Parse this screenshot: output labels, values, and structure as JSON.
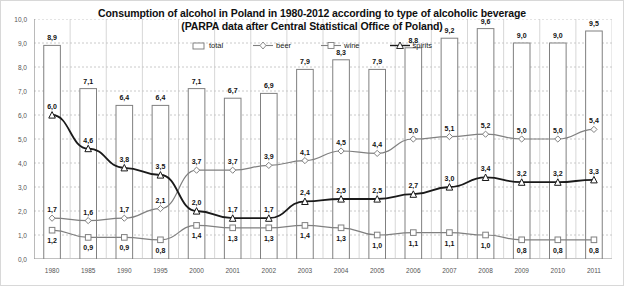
{
  "chart_data": {
    "type": "bar",
    "title": "Consumption of alcohol in Poland in 1980-2012 according to type of alcoholic beverage",
    "subtitle": "(PARPA data after Central Statistical Office of Poland)",
    "xlabel": "",
    "ylabel": "",
    "ylim": [
      0.0,
      10.0
    ],
    "ytick_labels": [
      "0,0",
      "1,0",
      "2,0",
      "3,0",
      "4,0",
      "5,0",
      "6,0",
      "7,0",
      "8,0",
      "9,0",
      "10,0"
    ],
    "ytick_values": [
      0,
      1,
      2,
      3,
      4,
      5,
      6,
      7,
      8,
      9,
      10
    ],
    "grid": true,
    "legend_position": "top-center",
    "decimal_separator": ",",
    "categories": [
      "1980",
      "1985",
      "1990",
      "1995",
      "2000",
      "2001",
      "2002",
      "2003",
      "2004",
      "2005",
      "2006",
      "2007",
      "2008",
      "2009",
      "2010",
      "2011"
    ],
    "series": [
      {
        "name": "total",
        "type": "bar",
        "marker": "rectangle",
        "color": "#ffffff",
        "edge_color": "#808080",
        "values": [
          8.9,
          7.1,
          6.4,
          6.4,
          7.1,
          6.7,
          6.9,
          7.9,
          8.3,
          7.9,
          8.8,
          9.2,
          9.6,
          9.0,
          9.0,
          9.5
        ],
        "labels": [
          "8,9",
          "7,1",
          "6,4",
          "6,4",
          "7,1",
          "6,7",
          "6,9",
          "7,9",
          "8,3",
          "7,9",
          "8,8",
          "9,2",
          "9,6",
          "9,0",
          "9,0",
          "9,5"
        ]
      },
      {
        "name": "beer",
        "type": "line",
        "marker": "diamond",
        "color": "#808080",
        "values": [
          1.7,
          1.6,
          1.7,
          2.1,
          3.7,
          3.7,
          3.9,
          4.1,
          4.5,
          4.4,
          5.0,
          5.1,
          5.2,
          5.0,
          5.0,
          5.4
        ],
        "labels": [
          "1,7",
          "1,6",
          "1,7",
          "2,1",
          "3,7",
          "3,7",
          "3,9",
          "4,1",
          "4,5",
          "4,4",
          "5,0",
          "5,1",
          "5,2",
          "5,0",
          "5,0",
          "5,4"
        ]
      },
      {
        "name": "wine",
        "type": "line",
        "marker": "square",
        "color": "#808080",
        "values": [
          1.2,
          0.9,
          0.9,
          0.8,
          1.4,
          1.3,
          1.3,
          1.4,
          1.3,
          1.0,
          1.1,
          1.1,
          1.0,
          0.8,
          0.8,
          0.8
        ],
        "labels": [
          "1,2",
          "0,9",
          "0,9",
          "0,8",
          "1,4",
          "1,3",
          "1,3",
          "1,4",
          "1,3",
          "1,0",
          "1,1",
          "1,1",
          "1,0",
          "0,8",
          "0,8",
          "0,8"
        ]
      },
      {
        "name": "spirits",
        "type": "line",
        "marker": "triangle",
        "color": "#1a1a1a",
        "values": [
          6.0,
          4.6,
          3.8,
          3.5,
          2.0,
          1.7,
          1.7,
          2.4,
          2.5,
          2.5,
          2.7,
          3.0,
          3.4,
          3.2,
          3.2,
          3.3
        ],
        "labels": [
          "6,0",
          "4,6",
          "3,8",
          "3,5",
          "2,0",
          "1,7",
          "1,7",
          "2,4",
          "2,5",
          "2,5",
          "2,7",
          "3,0",
          "3,4",
          "3,2",
          "3,2",
          "3,3"
        ]
      }
    ]
  },
  "legend": {
    "items": [
      {
        "label": "total"
      },
      {
        "label": "beer"
      },
      {
        "label": "wine"
      },
      {
        "label": "spirits"
      }
    ]
  }
}
